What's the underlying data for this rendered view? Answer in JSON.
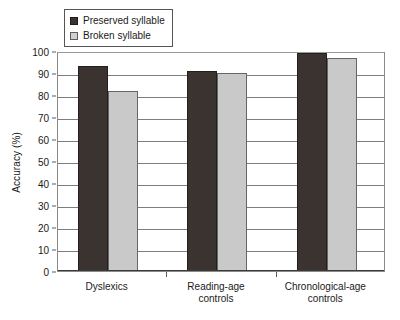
{
  "chart_data": {
    "type": "bar",
    "title": "",
    "xlabel": "",
    "ylabel": "Accuracy (%)",
    "ylim": [
      0,
      100
    ],
    "ytick_step": 10,
    "yticks": [
      100,
      90,
      80,
      70,
      60,
      50,
      40,
      30,
      20,
      10,
      0
    ],
    "grid": true,
    "legend_position": "top-left",
    "categories": [
      "Dyslexics",
      "Reading-age\ncontrols",
      "Chronological-age\ncontrols"
    ],
    "category_lines": [
      [
        "Dyslexics"
      ],
      [
        "Reading-age",
        "controls"
      ],
      [
        "Chronological-age",
        "controls"
      ]
    ],
    "series": [
      {
        "name": "Preserved syllable",
        "color": "#3a3330",
        "values": [
          93,
          91,
          99
        ]
      },
      {
        "name": "Broken syllable",
        "color": "#c9c9c9",
        "values": [
          82,
          90,
          97
        ]
      }
    ]
  },
  "legend": {
    "items": [
      {
        "label": "Preserved syllable",
        "swatch": "preserved"
      },
      {
        "label": "Broken syllable",
        "swatch": "broken"
      }
    ]
  },
  "axis": {
    "y_title": "Accuracy (%)"
  }
}
